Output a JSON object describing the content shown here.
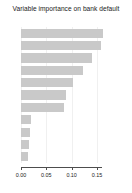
{
  "chart_data": {
    "type": "bar",
    "orientation": "horizontal",
    "title": "Variable importance on bank default",
    "xlabel": "",
    "ylabel": "",
    "xlim": [
      0.0,
      0.16
    ],
    "xticks": [
      0.0,
      0.05,
      0.1,
      0.15
    ],
    "xtick_labels": [
      "0.00",
      "0.05",
      "0.10",
      "0.15"
    ],
    "grid": true,
    "grid_axis": "x",
    "bar_color": "#c9c9c9",
    "axis_color": "#4d4d4d",
    "categories": [
      "X9",
      "X6",
      "X8",
      "X5",
      "X3",
      "X4",
      "X7",
      "X2",
      "X1",
      "X11",
      "X10"
    ],
    "values": [
      0.1611,
      0.1574,
      0.1407,
      0.1222,
      0.1019,
      0.0889,
      0.0852,
      0.0204,
      0.0185,
      0.0167,
      0.0148
    ]
  }
}
